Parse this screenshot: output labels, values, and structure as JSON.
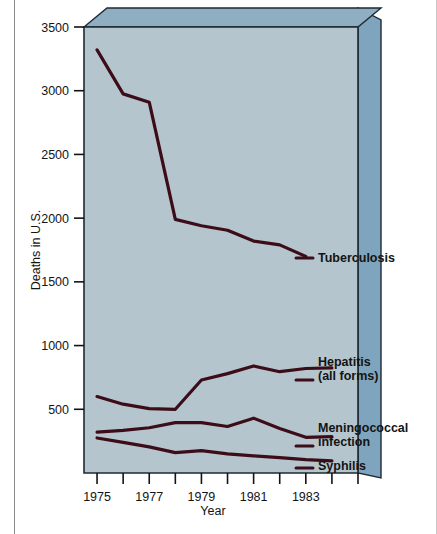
{
  "figure": {
    "name": "deaths-in-us-line-chart",
    "background_color": "#ffffff",
    "page_border_color": "#7a7a7a",
    "plot_fill_color": "#b4c4cc",
    "plot_side_color": "#7fa4be",
    "plot_top_color": "#93b0c4",
    "plot_edge_color": "#1d2a34",
    "line_color": "#3c0d18"
  },
  "chart_data": {
    "type": "line",
    "title": "",
    "xlabel": "Year",
    "ylabel": "Deaths in U.S.",
    "xlim": [
      1974.5,
      1985.0
    ],
    "ylim": [
      0,
      3500
    ],
    "grid": false,
    "legend_position": "right-inline-labels",
    "y_ticks": [
      500,
      1000,
      1500,
      2000,
      2500,
      3000,
      3500
    ],
    "y_tick_labels": [
      "500",
      "1000",
      "1500",
      "2000",
      "2500",
      "3000",
      "3500"
    ],
    "x_ticks": [
      1975,
      1976,
      1977,
      1978,
      1979,
      1980,
      1981,
      1982,
      1983,
      1984
    ],
    "x_tick_labels_major": [
      "1975",
      "1977",
      "1979",
      "1981",
      "1983"
    ],
    "x_major_years": [
      1975,
      1977,
      1979,
      1981,
      1983
    ],
    "x": [
      1975,
      1976,
      1977,
      1978,
      1979,
      1980,
      1981,
      1982,
      1983,
      1984
    ],
    "series": [
      {
        "name": "Tuberculosis",
        "label": "Tuberculosis",
        "label_lines": [
          "Tuberculosis"
        ],
        "values": [
          3320,
          2975,
          2910,
          1990,
          1940,
          1905,
          1820,
          1790,
          1700,
          null
        ]
      },
      {
        "name": "Hepatitis (all forms)",
        "label": "Hepatitis (all forms)",
        "label_lines": [
          "Hepatitis",
          "(all forms)"
        ],
        "values": [
          600,
          540,
          505,
          500,
          730,
          780,
          840,
          795,
          820,
          825
        ]
      },
      {
        "name": "Meningococcal infection",
        "label": "Meningococcal infection",
        "label_lines": [
          "Meningococcal",
          "infection"
        ],
        "values": [
          320,
          335,
          355,
          395,
          395,
          365,
          430,
          350,
          280,
          285
        ]
      },
      {
        "name": "Syphilis",
        "label": "Syphilis",
        "label_lines": [
          "Syphilis"
        ],
        "values": [
          275,
          240,
          205,
          160,
          175,
          150,
          135,
          120,
          105,
          95
        ]
      }
    ]
  }
}
